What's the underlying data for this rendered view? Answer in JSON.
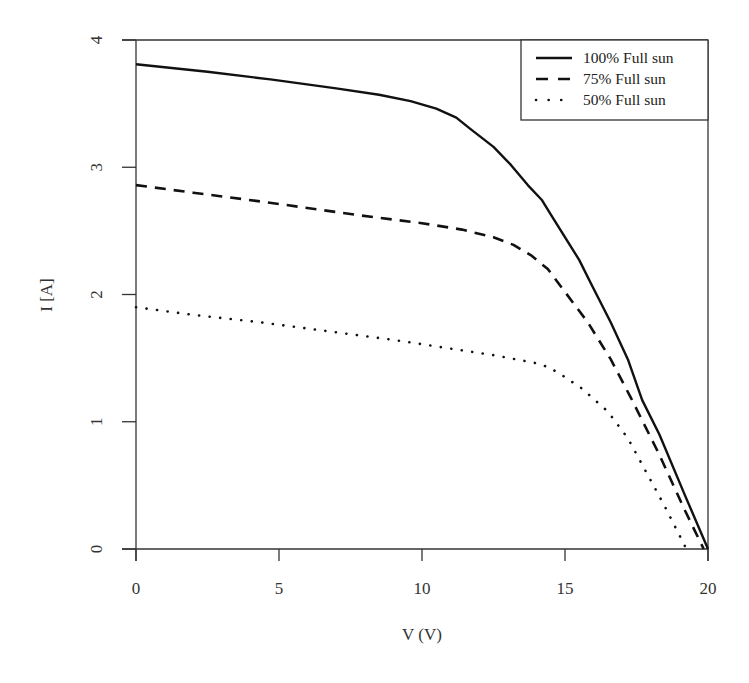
{
  "chart_data": {
    "type": "line",
    "title": "",
    "xlabel": "V (V)",
    "ylabel": "I [A]",
    "xlim": [
      0,
      20
    ],
    "ylim": [
      0,
      4
    ],
    "x_ticks": [
      0,
      5,
      10,
      15,
      20
    ],
    "y_ticks": [
      0,
      1,
      2,
      3,
      4
    ],
    "grid": false,
    "legend_position": "top-right",
    "series": [
      {
        "name": "100% Full sun",
        "style": "solid",
        "points": [
          [
            0,
            3.81
          ],
          [
            2.5,
            3.75
          ],
          [
            4.7,
            3.69
          ],
          [
            7,
            3.62
          ],
          [
            8.5,
            3.57
          ],
          [
            9.6,
            3.52
          ],
          [
            10.5,
            3.46
          ],
          [
            11.2,
            3.39
          ],
          [
            11.7,
            3.3
          ],
          [
            12.5,
            3.16
          ],
          [
            13.1,
            3.02
          ],
          [
            13.7,
            2.86
          ],
          [
            14.2,
            2.74
          ],
          [
            14.5,
            2.63
          ],
          [
            15.5,
            2.27
          ],
          [
            15.9,
            2.09
          ],
          [
            16.6,
            1.78
          ],
          [
            17.2,
            1.49
          ],
          [
            17.7,
            1.17
          ],
          [
            18.3,
            0.9
          ],
          [
            19.2,
            0.42
          ],
          [
            20,
            0
          ]
        ]
      },
      {
        "name": "75% Full sun",
        "style": "dashed",
        "points": [
          [
            0,
            2.86
          ],
          [
            2,
            2.8
          ],
          [
            4.4,
            2.73
          ],
          [
            7.9,
            2.62
          ],
          [
            10,
            2.56
          ],
          [
            11.4,
            2.51
          ],
          [
            12.5,
            2.45
          ],
          [
            13.2,
            2.39
          ],
          [
            13.8,
            2.31
          ],
          [
            14.4,
            2.2
          ],
          [
            14.9,
            2.05
          ],
          [
            15.8,
            1.78
          ],
          [
            16.6,
            1.49
          ],
          [
            17.3,
            1.19
          ],
          [
            18.3,
            0.74
          ],
          [
            19.2,
            0.3
          ],
          [
            19.85,
            0
          ]
        ]
      },
      {
        "name": "50% Full sun",
        "style": "dotted",
        "points": [
          [
            0,
            1.9
          ],
          [
            2,
            1.84
          ],
          [
            4.4,
            1.78
          ],
          [
            9.1,
            1.64
          ],
          [
            12.6,
            1.52
          ],
          [
            14.0,
            1.46
          ],
          [
            14.4,
            1.43
          ],
          [
            14.8,
            1.38
          ],
          [
            15.6,
            1.26
          ],
          [
            16.5,
            1.08
          ],
          [
            17.2,
            0.87
          ],
          [
            17.9,
            0.58
          ],
          [
            18.5,
            0.33
          ],
          [
            19.2,
            0.02
          ]
        ]
      }
    ]
  },
  "colors": {
    "line": "#111111",
    "axis": "#333333",
    "background": "#ffffff"
  },
  "layout": {
    "plot_left": 136,
    "plot_right": 708,
    "plot_top": 40,
    "plot_bottom": 549
  }
}
